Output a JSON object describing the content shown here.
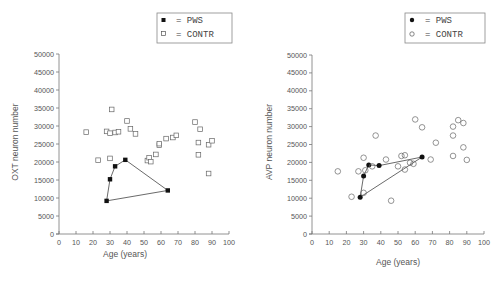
{
  "chart_data": [
    {
      "type": "scatter",
      "title": "",
      "xlabel": "Age (years)",
      "ylabel": "OXT neuron number",
      "xlim": [
        0,
        100
      ],
      "ylim": [
        0,
        50000
      ],
      "xticks": [
        0,
        10,
        20,
        30,
        40,
        50,
        60,
        70,
        80,
        90,
        100
      ],
      "yticks": [
        0,
        5000,
        10000,
        15000,
        20000,
        25000,
        30000,
        35000,
        40000,
        45000,
        50000
      ],
      "grid": false,
      "legend": {
        "position": "top-right",
        "entries": [
          {
            "marker": "filled-square",
            "label": "= PWS"
          },
          {
            "marker": "open-square",
            "label": "= CONTR"
          }
        ]
      },
      "series": [
        {
          "name": "PWS",
          "marker": "filled-square",
          "connected_polygon": true,
          "points": [
            [
              28,
              9200
            ],
            [
              30,
              15200
            ],
            [
              33,
              18800
            ],
            [
              39,
              20600
            ],
            [
              64,
              12100
            ]
          ],
          "polygon_order": [
            [
              28,
              9200
            ],
            [
              30,
              15200
            ],
            [
              33,
              18800
            ],
            [
              39,
              20600
            ],
            [
              64,
              12100
            ],
            [
              28,
              9200
            ]
          ]
        },
        {
          "name": "CONTR",
          "marker": "open-square",
          "points": [
            [
              16,
              28300
            ],
            [
              23,
              20500
            ],
            [
              28,
              28500
            ],
            [
              30,
              21000
            ],
            [
              30,
              28000
            ],
            [
              31,
              34600
            ],
            [
              33,
              28200
            ],
            [
              35,
              28400
            ],
            [
              40,
              31400
            ],
            [
              42,
              29200
            ],
            [
              45,
              27800
            ],
            [
              52,
              20400
            ],
            [
              53,
              21200
            ],
            [
              54,
              20100
            ],
            [
              57,
              22100
            ],
            [
              59,
              24700
            ],
            [
              59,
              25100
            ],
            [
              63,
              26500
            ],
            [
              67,
              26800
            ],
            [
              69,
              27400
            ],
            [
              80,
              31100
            ],
            [
              83,
              29100
            ],
            [
              82,
              25400
            ],
            [
              82,
              22000
            ],
            [
              88,
              24800
            ],
            [
              88,
              16800
            ],
            [
              90,
              25900
            ]
          ]
        }
      ]
    },
    {
      "type": "scatter",
      "title": "",
      "xlabel": "Age (years)",
      "ylabel": "AVP neuron number",
      "xlim": [
        0,
        100
      ],
      "ylim": [
        0,
        50000
      ],
      "xticks": [
        0,
        10,
        20,
        30,
        40,
        50,
        60,
        70,
        80,
        90,
        100
      ],
      "yticks": [
        0,
        5000,
        10000,
        15000,
        20000,
        25000,
        30000,
        35000,
        40000,
        45000,
        50000
      ],
      "grid": false,
      "legend": {
        "position": "top-right",
        "entries": [
          {
            "marker": "filled-circle",
            "label": "= PWS"
          },
          {
            "marker": "open-circle",
            "label": "= CONTR"
          }
        ]
      },
      "series": [
        {
          "name": "PWS",
          "marker": "filled-circle",
          "connected_polygon": true,
          "points": [
            [
              28,
              10300
            ],
            [
              30,
              16200
            ],
            [
              33,
              19300
            ],
            [
              39,
              19100
            ],
            [
              64,
              21500
            ]
          ],
          "polygon_order": [
            [
              28,
              10300
            ],
            [
              30,
              16200
            ],
            [
              33,
              19300
            ],
            [
              39,
              19100
            ],
            [
              64,
              21500
            ],
            [
              28,
              10300
            ]
          ]
        },
        {
          "name": "CONTR",
          "marker": "open-circle",
          "points": [
            [
              15,
              17500
            ],
            [
              23,
              10400
            ],
            [
              27,
              17500
            ],
            [
              30,
              21300
            ],
            [
              30,
              11500
            ],
            [
              31,
              17800
            ],
            [
              35,
              18900
            ],
            [
              37,
              27500
            ],
            [
              43,
              20800
            ],
            [
              46,
              9300
            ],
            [
              50,
              18900
            ],
            [
              52,
              21800
            ],
            [
              54,
              22000
            ],
            [
              54,
              18000
            ],
            [
              57,
              19900
            ],
            [
              59,
              19600
            ],
            [
              60,
              32000
            ],
            [
              64,
              29800
            ],
            [
              69,
              20800
            ],
            [
              72,
              25500
            ],
            [
              82,
              21800
            ],
            [
              82,
              27500
            ],
            [
              82,
              30000
            ],
            [
              85,
              31800
            ],
            [
              88,
              31000
            ],
            [
              88,
              24200
            ],
            [
              90,
              20700
            ]
          ]
        }
      ]
    }
  ],
  "charts": [
    {
      "legend": {
        "pws_label": "= PWS",
        "contr_label": "= CONTR"
      },
      "xlabel": "Age (years)",
      "ylabel": "OXT neuron number"
    },
    {
      "legend": {
        "pws_label": "= PWS",
        "contr_label": "= CONTR"
      },
      "xlabel": "Age (years)",
      "ylabel": "AVP neuron number"
    }
  ],
  "colors": {
    "axis": "#777777",
    "text": "#555555",
    "marker": "#111111",
    "line": "#444444"
  }
}
